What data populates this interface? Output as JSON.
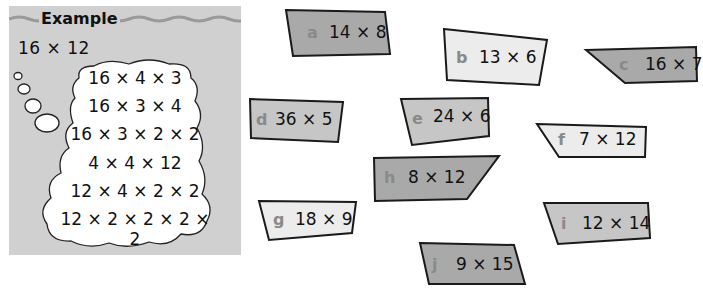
{
  "example": {
    "title": "Example",
    "problem": "16 × 12",
    "thoughts": [
      "16 × 4 × 3",
      "16 × 3 × 4",
      "16 × 3 × 2 × 2",
      "4 × 4 × 12",
      "12 × 4 × 2 × 2",
      "12 × 2 × 2 × 2 × 2"
    ]
  },
  "cards": [
    {
      "label": "a",
      "expr": "14 × 8"
    },
    {
      "label": "b",
      "expr": "13 × 6"
    },
    {
      "label": "c",
      "expr": "16 × 7"
    },
    {
      "label": "d",
      "expr": "36 × 5"
    },
    {
      "label": "e",
      "expr": "24 × 6"
    },
    {
      "label": "f",
      "expr": "7 × 12"
    },
    {
      "label": "g",
      "expr": "18 × 9"
    },
    {
      "label": "h",
      "expr": "8 × 12"
    },
    {
      "label": "i",
      "expr": "12 × 14"
    },
    {
      "label": "j",
      "expr": "9 × 15"
    }
  ],
  "colors": {
    "panel": "#d0d0d0",
    "card_dark": "#a9a9a9",
    "card_mid": "#c6c6c6",
    "card_light": "#ececec"
  }
}
